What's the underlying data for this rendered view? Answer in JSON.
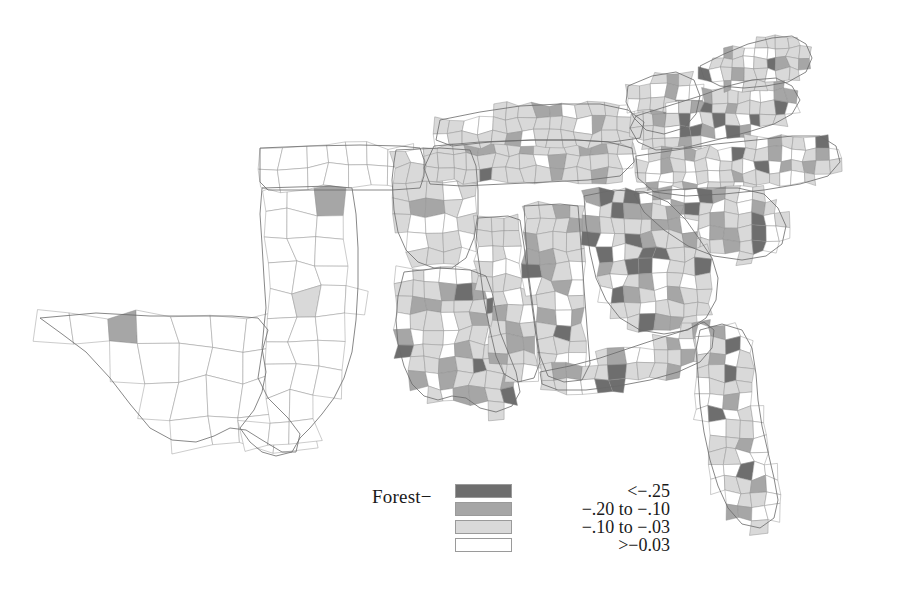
{
  "figure": {
    "type": "choropleth-map",
    "region": "United States — South / Southeast census region (county level)",
    "background_color": "#ffffff",
    "county_border_color": "#8d8d8d",
    "state_border_color": "#6a6a6a"
  },
  "legend": {
    "title": "Forest−",
    "title_name": "forest-change-legend-title",
    "position": "bottom-center",
    "classes": [
      {
        "label": "<−.25",
        "color": "#6e6e6e",
        "swatch_name": "legend-swatch-class-1"
      },
      {
        "label": "−.20 to −.10",
        "color": "#a6a6a6",
        "swatch_name": "legend-swatch-class-2"
      },
      {
        "label": "−.10 to −.03",
        "color": "#d9d9d9",
        "swatch_name": "legend-swatch-class-3"
      },
      {
        "label": ">−0.03",
        "color": "#ffffff",
        "swatch_name": "legend-swatch-class-4"
      }
    ]
  },
  "chart_data": {
    "type": "heatmap",
    "title": "Forest−",
    "xlabel": "",
    "ylabel": "",
    "grid": false,
    "legend_position": "bottom-center",
    "value_variable": "Change in forest cover (proportion)",
    "class_breaks": [
      {
        "class": 1,
        "range_label": "<−.25",
        "upper": -0.25,
        "lower": null,
        "color": "#6e6e6e"
      },
      {
        "class": 2,
        "range_label": "−.20 to −.10",
        "upper": -0.1,
        "lower": -0.2,
        "color": "#a6a6a6"
      },
      {
        "class": 3,
        "range_label": "−.10 to −.03",
        "upper": -0.03,
        "lower": -0.1,
        "color": "#d9d9d9"
      },
      {
        "class": 4,
        "range_label": ">−0.03",
        "upper": null,
        "lower": -0.03,
        "color": "#ffffff"
      }
    ],
    "regions": [
      {
        "name": "Texas (west & central)",
        "dominant_class": 4,
        "note": "almost entirely unshaded"
      },
      {
        "name": "Oklahoma",
        "dominant_class": 4,
        "note": "unshaded with isolated class-2 county"
      },
      {
        "name": "East Texas",
        "dominant_class": 3
      },
      {
        "name": "Arkansas",
        "dominant_class": 3,
        "note": "scattered class-1 and class-2 counties"
      },
      {
        "name": "Louisiana",
        "dominant_class": 3,
        "note": "dark class-1 cluster near the delta"
      },
      {
        "name": "Mississippi",
        "dominant_class": 3
      },
      {
        "name": "Alabama",
        "dominant_class": 3,
        "note": "class-2 patches along the Gulf coast"
      },
      {
        "name": "Tennessee",
        "dominant_class": 3,
        "note": "class-1 cluster on the Cumberland Plateau"
      },
      {
        "name": "Kentucky",
        "dominant_class": 3
      },
      {
        "name": "Georgia",
        "dominant_class": 3,
        "note": "heavy class-1 and class-2 clustering in the north"
      },
      {
        "name": "South Carolina",
        "dominant_class": 3,
        "note": "class-1 counties near the coast"
      },
      {
        "name": "North Carolina",
        "dominant_class": 3
      },
      {
        "name": "Virginia",
        "dominant_class": 2,
        "note": "strong class-1 cluster around the northern metro area"
      },
      {
        "name": "West Virginia",
        "dominant_class": 3
      },
      {
        "name": "Maryland / Delaware",
        "dominant_class": 2
      },
      {
        "name": "Florida panhandle",
        "dominant_class": 3,
        "note": "class-1 counties on the north peninsula"
      },
      {
        "name": "Florida peninsula (south)",
        "dominant_class": 4,
        "note": "mostly unshaded with a dark southern tip"
      }
    ]
  }
}
